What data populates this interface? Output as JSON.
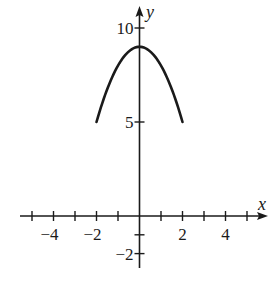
{
  "chart_data": {
    "type": "line",
    "title": "",
    "xlabel": "x",
    "ylabel": "y",
    "function": "y = 9 - x^2",
    "xlim": [
      -5.5,
      5.8
    ],
    "ylim": [
      -2.5,
      10.8
    ],
    "grid": false,
    "legend": null,
    "x_ticks": [
      -5,
      -4,
      -3,
      -2,
      -1,
      0,
      1,
      2,
      3,
      4,
      5
    ],
    "x_tick_labels": [
      {
        "value": -4,
        "label": "−4"
      },
      {
        "value": -2,
        "label": "−2"
      },
      {
        "value": 2,
        "label": "2"
      },
      {
        "value": 4,
        "label": "4"
      }
    ],
    "y_ticks": [
      -2,
      -1,
      5,
      10
    ],
    "y_tick_labels": [
      {
        "value": 10,
        "label": "10"
      },
      {
        "value": 5,
        "label": "5"
      },
      {
        "value": -2,
        "label": "−2"
      }
    ],
    "series": [
      {
        "name": "parabola",
        "x": [
          -2,
          -1.5,
          -1,
          -0.5,
          0,
          0.5,
          1,
          1.5,
          2
        ],
        "y": [
          5,
          6.75,
          8,
          8.75,
          9,
          8.75,
          8,
          6.75,
          5
        ]
      }
    ],
    "color": "#1a1a1a"
  }
}
